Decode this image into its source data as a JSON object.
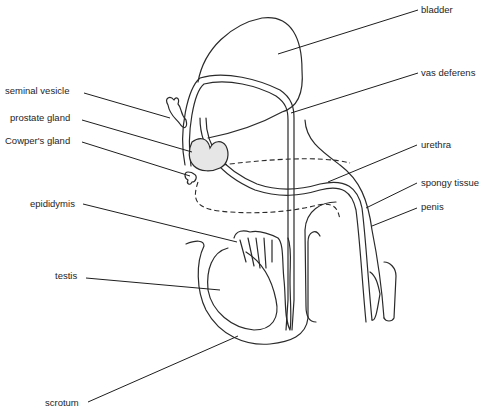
{
  "diagram": {
    "style": {
      "line_color": "#2a2a2a",
      "background": "#ffffff",
      "gland_fill": "#e6e6e6"
    },
    "labels": {
      "bladder": "bladder",
      "vas_deferens": "vas deferens",
      "seminal_vesicle": "seminal vesicle",
      "prostate_gland": "prostate gland",
      "cowpers_gland": "Cowper's gland",
      "urethra": "urethra",
      "spongy_tissue": "spongy tissue",
      "penis": "penis",
      "epididymis": "epididymis",
      "testis": "testis",
      "scrotum": "scrotum"
    }
  }
}
